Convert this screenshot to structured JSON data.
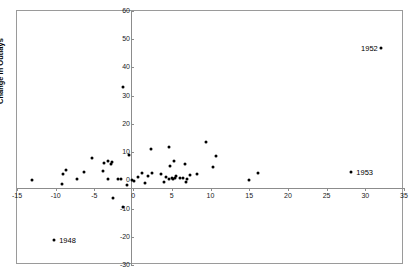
{
  "chart_data": {
    "type": "scatter",
    "title": "",
    "xlabel": "",
    "ylabel": "Change in Outlays",
    "xlim": [
      -15,
      35
    ],
    "ylim": [
      -30,
      60
    ],
    "grid": false,
    "legend": "none",
    "xticks": [
      -15,
      -10,
      -5,
      0,
      5,
      10,
      15,
      20,
      25,
      30,
      35
    ],
    "xtick_labels": [
      "-15",
      "-10",
      "-5",
      "0",
      "5",
      "10",
      "15",
      "20",
      "25",
      "30",
      "35"
    ],
    "yticks": [
      -30,
      -20,
      -10,
      0,
      10,
      20,
      30,
      40,
      50,
      60
    ],
    "ytick_labels": [
      "-30",
      "-20",
      "-10",
      "0",
      "10",
      "20",
      "30",
      "40",
      "50",
      "60"
    ],
    "marker": "filled-diamond",
    "marker_color": "#000000",
    "points": [
      {
        "x": 32.0,
        "y": 47.0,
        "label": "1952",
        "label_side": "left"
      },
      {
        "x": 28.2,
        "y": 3.0,
        "label": "1953",
        "label_side": "right"
      },
      {
        "x": -10.2,
        "y": -21.0,
        "label": "1948",
        "label_side": "right"
      },
      {
        "x": -1.3,
        "y": 33.0,
        "label": ""
      },
      {
        "x": 9.4,
        "y": 13.5,
        "label": ""
      },
      {
        "x": 4.7,
        "y": 11.8,
        "label": ""
      },
      {
        "x": 2.3,
        "y": 11.0,
        "label": ""
      },
      {
        "x": 10.7,
        "y": 8.7,
        "label": ""
      },
      {
        "x": -0.5,
        "y": 9.0,
        "label": ""
      },
      {
        "x": -5.3,
        "y": 8.0,
        "label": ""
      },
      {
        "x": -3.2,
        "y": 6.7,
        "label": ""
      },
      {
        "x": -2.7,
        "y": 6.6,
        "label": ""
      },
      {
        "x": -3.8,
        "y": 6.0,
        "label": ""
      },
      {
        "x": -2.9,
        "y": 5.7,
        "label": ""
      },
      {
        "x": 5.3,
        "y": 7.0,
        "label": ""
      },
      {
        "x": 6.7,
        "y": 5.9,
        "label": ""
      },
      {
        "x": 10.3,
        "y": 4.7,
        "label": ""
      },
      {
        "x": 4.8,
        "y": 5.2,
        "label": ""
      },
      {
        "x": -8.7,
        "y": 3.7,
        "label": ""
      },
      {
        "x": -9.0,
        "y": 2.3,
        "label": ""
      },
      {
        "x": -6.3,
        "y": 2.8,
        "label": ""
      },
      {
        "x": -3.9,
        "y": 3.2,
        "label": ""
      },
      {
        "x": 1.2,
        "y": 2.6,
        "label": ""
      },
      {
        "x": 2.5,
        "y": 2.7,
        "label": ""
      },
      {
        "x": 3.6,
        "y": 2.3,
        "label": ""
      },
      {
        "x": 16.2,
        "y": 2.5,
        "label": ""
      },
      {
        "x": 8.3,
        "y": 2.2,
        "label": ""
      },
      {
        "x": 7.3,
        "y": 1.9,
        "label": ""
      },
      {
        "x": 1.9,
        "y": 1.6,
        "label": ""
      },
      {
        "x": 5.6,
        "y": 1.5,
        "label": ""
      },
      {
        "x": 0.6,
        "y": 1.1,
        "label": ""
      },
      {
        "x": 4.2,
        "y": 1.2,
        "label": ""
      },
      {
        "x": 5.0,
        "y": 1.0,
        "label": ""
      },
      {
        "x": 5.4,
        "y": 0.9,
        "label": ""
      },
      {
        "x": 6.1,
        "y": 1.0,
        "label": ""
      },
      {
        "x": 6.4,
        "y": 0.8,
        "label": ""
      },
      {
        "x": 7.0,
        "y": 0.6,
        "label": ""
      },
      {
        "x": 5.1,
        "y": 0.4,
        "label": ""
      },
      {
        "x": 4.6,
        "y": 0.3,
        "label": ""
      },
      {
        "x": -0.1,
        "y": 0.2,
        "label": ""
      },
      {
        "x": -1.6,
        "y": 0.5,
        "label": ""
      },
      {
        "x": -1.9,
        "y": 0.5,
        "label": ""
      },
      {
        "x": -3.2,
        "y": 0.4,
        "label": ""
      },
      {
        "x": -7.2,
        "y": 0.3,
        "label": ""
      },
      {
        "x": -13.0,
        "y": 0.2,
        "label": ""
      },
      {
        "x": 15.0,
        "y": 0.0,
        "label": ""
      },
      {
        "x": 0.1,
        "y": -0.4,
        "label": ""
      },
      {
        "x": 4.0,
        "y": -0.6,
        "label": ""
      },
      {
        "x": 1.5,
        "y": -0.9,
        "label": ""
      },
      {
        "x": 6.8,
        "y": -0.7,
        "label": ""
      },
      {
        "x": -9.2,
        "y": -1.2,
        "label": ""
      },
      {
        "x": -0.8,
        "y": -1.8,
        "label": ""
      },
      {
        "x": -2.6,
        "y": -6.2,
        "label": ""
      },
      {
        "x": -1.3,
        "y": -9.3,
        "label": ""
      }
    ]
  }
}
